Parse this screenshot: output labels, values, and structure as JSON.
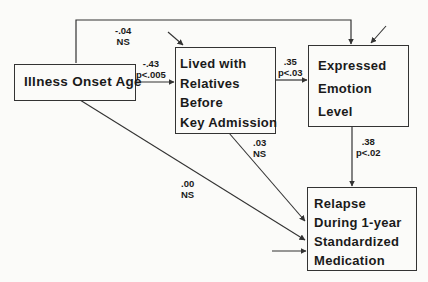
{
  "diagram": {
    "type": "path-diagram",
    "nodes": [
      {
        "id": "onset",
        "lines": [
          "Illness Onset Age"
        ]
      },
      {
        "id": "relatives",
        "lines": [
          "Lived with",
          "Relatives",
          "Before",
          "Key Admission"
        ]
      },
      {
        "id": "ee",
        "lines": [
          "Expressed",
          "Emotion",
          "Level"
        ]
      },
      {
        "id": "relapse",
        "lines": [
          "Relapse",
          "During 1-year",
          "Standardized",
          "Medication"
        ]
      }
    ],
    "paths": [
      {
        "from": "onset",
        "to": "ee",
        "coef": "-.04",
        "sig": "NS"
      },
      {
        "from": "onset",
        "to": "relatives",
        "coef": "-.43",
        "sig": "p<.005"
      },
      {
        "from": "relatives",
        "to": "ee",
        "coef": ".35",
        "sig": "p<.03"
      },
      {
        "from": "relatives",
        "to": "relapse",
        "coef": ".03",
        "sig": "NS"
      },
      {
        "from": "onset",
        "to": "relapse",
        "coef": ".00",
        "sig": "NS"
      },
      {
        "from": "ee",
        "to": "relapse",
        "coef": ".38",
        "sig": "p<.02"
      }
    ],
    "colors": {
      "line": "#333333",
      "text": "#1a1a1a",
      "background": "#fbfbf9"
    }
  }
}
